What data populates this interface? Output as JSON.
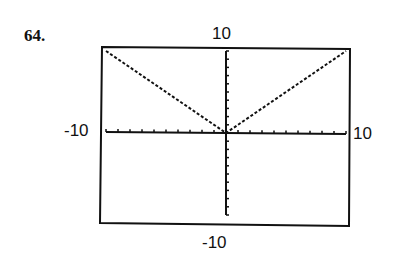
{
  "problem": {
    "number": "64."
  },
  "window": {
    "ymax_label": "10",
    "ymin_label": "-10",
    "xmin_label": "-10",
    "xmax_label": "10"
  },
  "colors": {
    "ink": "#111111",
    "background": "#ffffff"
  },
  "chart_data": {
    "type": "line",
    "title": "",
    "xlabel": "",
    "ylabel": "",
    "xlim": [
      -10,
      10
    ],
    "ylim": [
      -10,
      10
    ],
    "x_tick_step": 1,
    "y_tick_step": 1,
    "grid": false,
    "legend": null,
    "series": [
      {
        "name": "y = |x|",
        "style": "dotted",
        "x": [
          -10,
          0,
          10
        ],
        "y": [
          10,
          0,
          10
        ]
      }
    ],
    "annotations": [
      "10 (Ymax, top)",
      "-10 (Ymin, bottom)",
      "-10 (Xmin, left)",
      "10 (Xmax, right)"
    ]
  }
}
